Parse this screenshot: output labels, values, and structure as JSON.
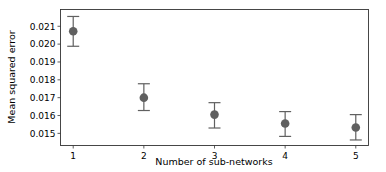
{
  "chart_data": {
    "type": "scatter",
    "title": "",
    "xlabel": "Number of sub-networks",
    "ylabel": "Mean squared error",
    "x": [
      1,
      2,
      3,
      4,
      5
    ],
    "series": [
      {
        "name": "MSE",
        "values": [
          0.02072,
          0.017,
          0.01605,
          0.01555,
          0.01533
        ],
        "error_low": [
          0.01988,
          0.01628,
          0.0153,
          0.01483,
          0.01463
        ],
        "error_high": [
          0.02155,
          0.01778,
          0.01672,
          0.01622,
          0.01605
        ],
        "color": "#606060"
      }
    ],
    "xticks": [
      "1",
      "2",
      "3",
      "4",
      "5"
    ],
    "yticks": [
      "0.015",
      "0.016",
      "0.017",
      "0.018",
      "0.019",
      "0.020",
      "0.021"
    ],
    "ylim": [
      0.01432,
      0.02194
    ],
    "xlim": [
      0.82,
      5.18
    ],
    "grid": false,
    "legend": null
  }
}
